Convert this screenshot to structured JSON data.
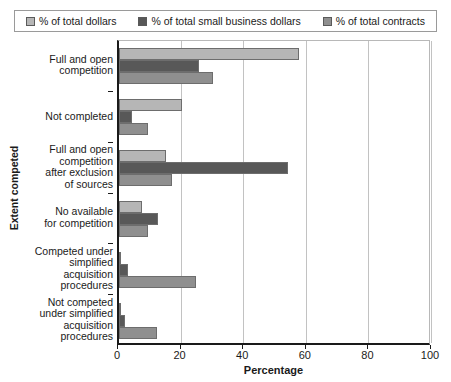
{
  "chart_data": {
    "type": "bar",
    "orientation": "horizontal",
    "title": "",
    "xlabel": "Percentage",
    "ylabel": "Extent competed",
    "xlim": [
      0,
      100
    ],
    "xticks": [
      0,
      20,
      40,
      60,
      80,
      100
    ],
    "grid": true,
    "legend_position": "top",
    "categories": [
      "Full and open\ncompetition",
      "Not completed",
      "Full and open\ncompetition\nafter exclusion\nof sources",
      "No available\nfor competition",
      "Competed under\nsimplified\nacquisition\nprocedures",
      "Not competed\nunder simplified\nacquisition\nprocedures"
    ],
    "series": [
      {
        "name": "% of total dollars",
        "color": "#b6b6b6",
        "values": [
          57.5,
          20.0,
          15.0,
          7.5,
          0.7,
          0.3
        ]
      },
      {
        "name": "% of total small business dollars",
        "color": "#585858",
        "values": [
          25.5,
          4.0,
          54.0,
          12.5,
          3.0,
          2.0
        ]
      },
      {
        "name": "% of total contracts",
        "color": "#8f8f8f",
        "values": [
          30.0,
          9.3,
          17.0,
          9.3,
          24.7,
          12.0
        ]
      }
    ]
  },
  "legend": {
    "entries": [
      {
        "label": "% of total dollars",
        "swatch": "#b6b6b6"
      },
      {
        "label": "% of total small business dollars",
        "swatch": "#585858"
      },
      {
        "label": "% of total contracts",
        "swatch": "#8f8f8f"
      }
    ]
  },
  "axes": {
    "x_title": "Percentage",
    "y_title": "Extent competed",
    "x_tick_labels": [
      "0",
      "20",
      "40",
      "60",
      "80",
      "100"
    ]
  },
  "category_labels": [
    [
      "Full and open",
      "competition"
    ],
    [
      "Not completed"
    ],
    [
      "Full and open",
      "competition",
      "after exclusion",
      "of sources"
    ],
    [
      "No available",
      "for competition"
    ],
    [
      "Competed under",
      "simplified",
      "acquisition",
      "procedures"
    ],
    [
      "Not competed",
      "under simplified",
      "acquisition",
      "procedures"
    ]
  ]
}
